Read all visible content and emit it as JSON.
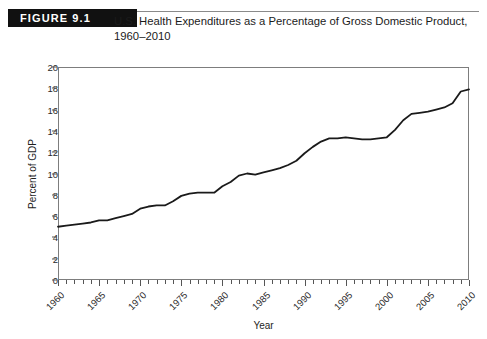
{
  "figure": {
    "badge_label": "FIGURE 9.1",
    "title_line1": "U.S. Health Expenditures as a Percentage of Gross Domestic Product,",
    "title_line2": "1960–2010"
  },
  "chart_data": {
    "type": "line",
    "title": "U.S. Health Expenditures as a Percentage of Gross Domestic Product, 1960–2010",
    "xlabel": "Year",
    "ylabel": "Percent of GDP",
    "xlim": [
      1960,
      2010
    ],
    "ylim": [
      0,
      20
    ],
    "ytick_labels": [
      "0",
      "2",
      "4",
      "6",
      "8",
      "10",
      "12",
      "14",
      "16",
      "18",
      "20"
    ],
    "ytick_values": [
      0,
      2,
      4,
      6,
      8,
      10,
      12,
      14,
      16,
      18,
      20
    ],
    "xtick_labels": [
      "1960",
      "1965",
      "1970",
      "1975",
      "1980",
      "1985",
      "1990",
      "1995",
      "2000",
      "2005",
      "2010"
    ],
    "xtick_values": [
      1960,
      1965,
      1970,
      1975,
      1980,
      1985,
      1990,
      1995,
      2000,
      2005,
      2010
    ],
    "minor_tick_interval": 1,
    "grid": false,
    "legend": false,
    "line_color": "#1a1a1a",
    "series": [
      {
        "name": "Health expenditures as percent of GDP",
        "x": [
          1960,
          1961,
          1962,
          1963,
          1964,
          1965,
          1966,
          1967,
          1968,
          1969,
          1970,
          1971,
          1972,
          1973,
          1974,
          1975,
          1976,
          1977,
          1978,
          1979,
          1980,
          1981,
          1982,
          1983,
          1984,
          1985,
          1986,
          1987,
          1988,
          1989,
          1990,
          1991,
          1992,
          1993,
          1994,
          1995,
          1996,
          1997,
          1998,
          1999,
          2000,
          2001,
          2002,
          2003,
          2004,
          2005,
          2006,
          2007,
          2008,
          2009,
          2010
        ],
        "values": [
          5.0,
          5.1,
          5.2,
          5.3,
          5.4,
          5.6,
          5.6,
          5.8,
          6.0,
          6.2,
          6.7,
          6.9,
          7.0,
          7.0,
          7.4,
          7.9,
          8.1,
          8.2,
          8.2,
          8.2,
          8.8,
          9.2,
          9.8,
          10.0,
          9.9,
          10.1,
          10.3,
          10.5,
          10.8,
          11.2,
          11.9,
          12.5,
          13.0,
          13.3,
          13.3,
          13.4,
          13.3,
          13.2,
          13.2,
          13.3,
          13.4,
          14.1,
          15.0,
          15.6,
          15.7,
          15.8,
          16.0,
          16.2,
          16.6,
          17.7,
          17.9
        ]
      }
    ]
  }
}
